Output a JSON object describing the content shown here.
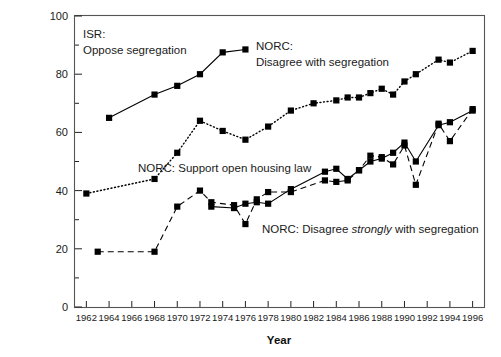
{
  "chart_data": {
    "type": "line",
    "title": "",
    "xlabel": "Year",
    "ylabel": "",
    "xlim": [
      1961,
      1997
    ],
    "ylim": [
      0,
      100
    ],
    "grid": false,
    "legend_position": "inline-annotations",
    "x_tick_labels": [
      "1962",
      "1964",
      "1966",
      "1968",
      "1970",
      "1972",
      "1974",
      "1976",
      "1978",
      "1980",
      "1982",
      "1984",
      "1986",
      "1988",
      "1990",
      "1992",
      "1994",
      "1996"
    ],
    "y_tick_labels": [
      "0",
      "20",
      "40",
      "60",
      "80",
      "100"
    ],
    "y_minor_ticks": [
      10,
      30,
      50,
      70,
      90
    ],
    "series": [
      {
        "name": "ISR: Oppose segregation",
        "line_style": "solid",
        "marker": "square",
        "x": [
          1964,
          1968,
          1970,
          1972,
          1974,
          1976
        ],
        "values": [
          65,
          73,
          76,
          80,
          87.5,
          88.5
        ]
      },
      {
        "name": "NORC: Disagree with segregation",
        "line_style": "dotted",
        "marker": "square",
        "x": [
          1962,
          1968,
          1970,
          1972,
          1974,
          1976,
          1978,
          1980,
          1982,
          1984,
          1985,
          1986,
          1987,
          1988,
          1989,
          1990,
          1991,
          1993,
          1994,
          1996
        ],
        "values": [
          39,
          44,
          53,
          64,
          60.5,
          57.5,
          62,
          67.5,
          70,
          71,
          72,
          72,
          73.5,
          75,
          73,
          77.5,
          80,
          85,
          84,
          88
        ]
      },
      {
        "name": "NORC: Support open housing law",
        "line_style": "solid",
        "marker": "square",
        "x": [
          1973,
          1975,
          1976,
          1977,
          1978,
          1980,
          1983,
          1984,
          1985,
          1986,
          1987,
          1988,
          1989,
          1990,
          1991,
          1993,
          1994,
          1996
        ],
        "values": [
          34.5,
          34,
          35.5,
          36,
          35.5,
          40.5,
          46.5,
          47.5,
          44,
          47,
          50,
          51,
          53,
          56.5,
          50,
          62.5,
          63.5,
          67.5
        ]
      },
      {
        "name": "NORC: Disagree strongly with segregation",
        "name_parts": [
          "NORC: Disagree ",
          "strongly",
          " with segregation"
        ],
        "line_style": "dashed",
        "marker": "square",
        "x": [
          1963,
          1968,
          1970,
          1972,
          1973,
          1975,
          1976,
          1977,
          1978,
          1980,
          1983,
          1984,
          1985,
          1986,
          1987,
          1988,
          1989,
          1990,
          1991,
          1993,
          1994,
          1996
        ],
        "values": [
          19,
          19,
          34.5,
          40,
          36,
          35,
          28.5,
          37,
          39.5,
          39.5,
          43.5,
          43,
          43.5,
          47,
          52,
          51.5,
          49,
          55.5,
          42,
          63,
          57,
          68
        ]
      }
    ],
    "annotations": [
      {
        "id": "isr-label",
        "line1": "ISR:",
        "line2": "Oppose segregation",
        "x": 83,
        "y": 38
      },
      {
        "id": "norc-disagree-label",
        "line1": "NORC:",
        "line2": "Disagree with segregation",
        "x": 256,
        "y": 50
      },
      {
        "id": "norc-open-housing-label",
        "text": "NORC: Support open housing law",
        "x": 138,
        "y": 172
      },
      {
        "id": "norc-strongly-label",
        "pre": "NORC: Disagree ",
        "em": "strongly",
        "post": " with segregation",
        "x": 262,
        "y": 233
      }
    ]
  },
  "axis": {
    "x_title": "Year"
  }
}
